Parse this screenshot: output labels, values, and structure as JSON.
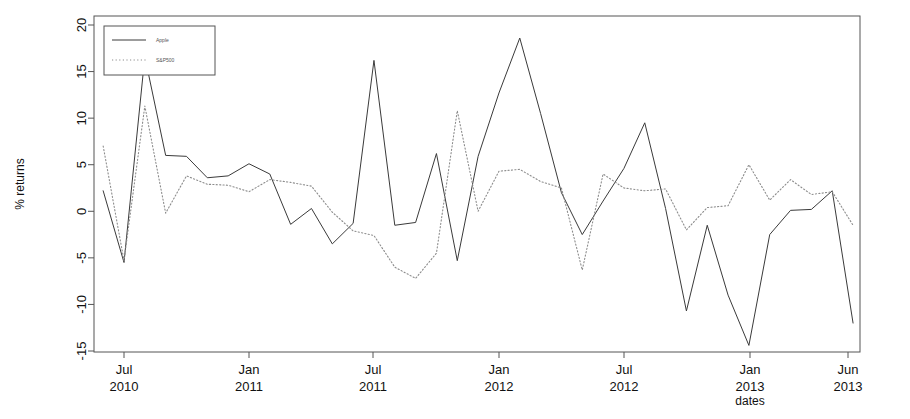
{
  "chart_data": {
    "type": "line",
    "title": "",
    "xlabel": "dates",
    "ylabel": "% returns",
    "ylim": [
      -15,
      20
    ],
    "yticks": [
      -15,
      -10,
      -5,
      0,
      5,
      10,
      15,
      20
    ],
    "ytick_labels": [
      "-15",
      "-10",
      "-5",
      "0",
      "5",
      "10",
      "15",
      "20"
    ],
    "xtick_labels": [
      {
        "month": "Jul",
        "year": "2010"
      },
      {
        "month": "Jan",
        "year": "2011"
      },
      {
        "month": "Jul",
        "year": "2011"
      },
      {
        "month": "Jan",
        "year": "2012"
      },
      {
        "month": "Jul",
        "year": "2012"
      },
      {
        "month": "Jan",
        "year": "2013"
      },
      {
        "month": "Jun",
        "year": "2013"
      }
    ],
    "x": [
      "2010-06",
      "2010-07",
      "2010-08",
      "2010-09",
      "2010-10",
      "2010-11",
      "2010-12",
      "2011-01",
      "2011-02",
      "2011-03",
      "2011-04",
      "2011-05",
      "2011-06",
      "2011-07",
      "2011-08",
      "2011-09",
      "2011-10",
      "2011-11",
      "2011-12",
      "2012-01",
      "2012-02",
      "2012-03",
      "2012-04",
      "2012-05",
      "2012-06",
      "2012-07",
      "2012-08",
      "2012-09",
      "2012-10",
      "2012-11",
      "2012-12",
      "2013-01",
      "2013-02",
      "2013-03",
      "2013-04",
      "2013-05",
      "2013-06"
    ],
    "grid": false,
    "legend_position": "top-left",
    "series": [
      {
        "name": "Apple",
        "style": "solid",
        "color": "#3a3a3a",
        "values": [
          2.2,
          -5.5,
          16.6,
          6.0,
          5.9,
          3.6,
          3.8,
          5.1,
          4.0,
          -1.4,
          0.3,
          -3.5,
          -1.3,
          16.2,
          -1.5,
          -1.2,
          6.2,
          -5.3,
          5.9,
          12.7,
          18.6,
          10.5,
          2.0,
          -2.5,
          1.1,
          4.6,
          9.5,
          0.3,
          -10.7,
          -1.5,
          -9.0,
          -14.4,
          -2.5,
          0.1,
          0.2,
          2.2,
          -12.0
        ]
      },
      {
        "name": "S&P500",
        "style": "dotted",
        "color": "#8c8c8c",
        "values": [
          7.0,
          -5.3,
          11.3,
          -0.2,
          3.8,
          2.9,
          2.8,
          2.1,
          3.4,
          3.1,
          2.7,
          -0.1,
          -2.1,
          -2.6,
          -6.0,
          -7.2,
          -4.5,
          10.8,
          0.0,
          4.3,
          4.5,
          3.2,
          2.5,
          -6.3,
          4.0,
          2.5,
          2.2,
          2.4,
          -2.0,
          0.4,
          0.6,
          5.0,
          1.2,
          3.4,
          1.8,
          2.1,
          -1.5
        ]
      }
    ]
  },
  "legend": {
    "items": [
      {
        "label": "Apple",
        "style": "solid"
      },
      {
        "label": "S&P500",
        "style": "dotted"
      }
    ]
  }
}
